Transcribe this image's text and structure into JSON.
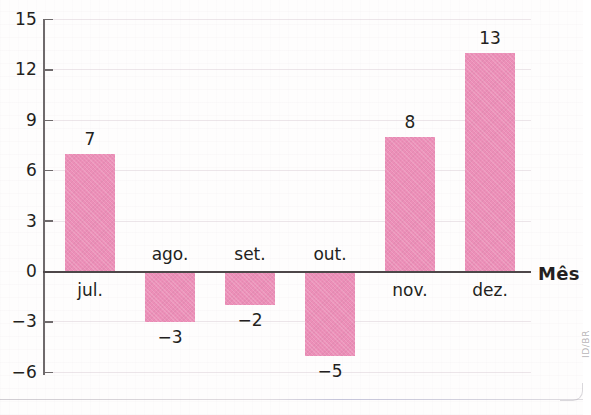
{
  "chart_data": {
    "type": "bar",
    "title": "",
    "subtitle": "",
    "xlabel": "Mês",
    "ylabel": "",
    "categories": [
      "jul.",
      "ago.",
      "set.",
      "out.",
      "nov.",
      "dez."
    ],
    "values": [
      7,
      -3,
      -2,
      -5,
      8,
      13
    ],
    "data_labels": [
      "7",
      "−3",
      "−2",
      "−5",
      "8",
      "13"
    ],
    "ylim": [
      -6,
      15
    ],
    "yticks": [
      15,
      12,
      9,
      6,
      3,
      0,
      -3,
      -6
    ],
    "ytick_labels": [
      "15",
      "12",
      "9",
      "6",
      "3",
      "0",
      "−3",
      "−6"
    ],
    "grid": true,
    "legend": false,
    "legend_position": "none",
    "bar_color": "#ec8fb8",
    "axis_color": "#4d4749",
    "text_color": "#231f20"
  },
  "credit": {
    "text": "ID/BR"
  }
}
